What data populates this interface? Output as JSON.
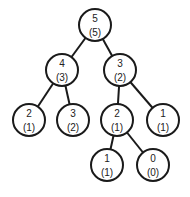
{
  "diagram": {
    "type": "tree",
    "colors": {
      "stroke": "#1a1a1a",
      "fill": "#ffffff",
      "text": "#222222"
    },
    "node_radius": 16,
    "nodes": [
      {
        "id": "n0",
        "value": "5",
        "sub": "(5)",
        "x": 95,
        "y": 25
      },
      {
        "id": "n1",
        "value": "4",
        "sub": "(3)",
        "x": 62,
        "y": 70
      },
      {
        "id": "n2",
        "value": "3",
        "sub": "(2)",
        "x": 120,
        "y": 70
      },
      {
        "id": "n3",
        "value": "2",
        "sub": "(1)",
        "x": 29,
        "y": 120
      },
      {
        "id": "n4",
        "value": "3",
        "sub": "(2)",
        "x": 73,
        "y": 120
      },
      {
        "id": "n5",
        "value": "2",
        "sub": "(1)",
        "x": 117,
        "y": 120
      },
      {
        "id": "n6",
        "value": "1",
        "sub": "(1)",
        "x": 163,
        "y": 120
      },
      {
        "id": "n7",
        "value": "1",
        "sub": "(1)",
        "x": 107,
        "y": 165
      },
      {
        "id": "n8",
        "value": "0",
        "sub": "(0)",
        "x": 153,
        "y": 165
      }
    ],
    "edges": [
      [
        "n0",
        "n1"
      ],
      [
        "n0",
        "n2"
      ],
      [
        "n1",
        "n3"
      ],
      [
        "n1",
        "n4"
      ],
      [
        "n2",
        "n5"
      ],
      [
        "n2",
        "n6"
      ],
      [
        "n5",
        "n7"
      ],
      [
        "n5",
        "n8"
      ]
    ]
  }
}
